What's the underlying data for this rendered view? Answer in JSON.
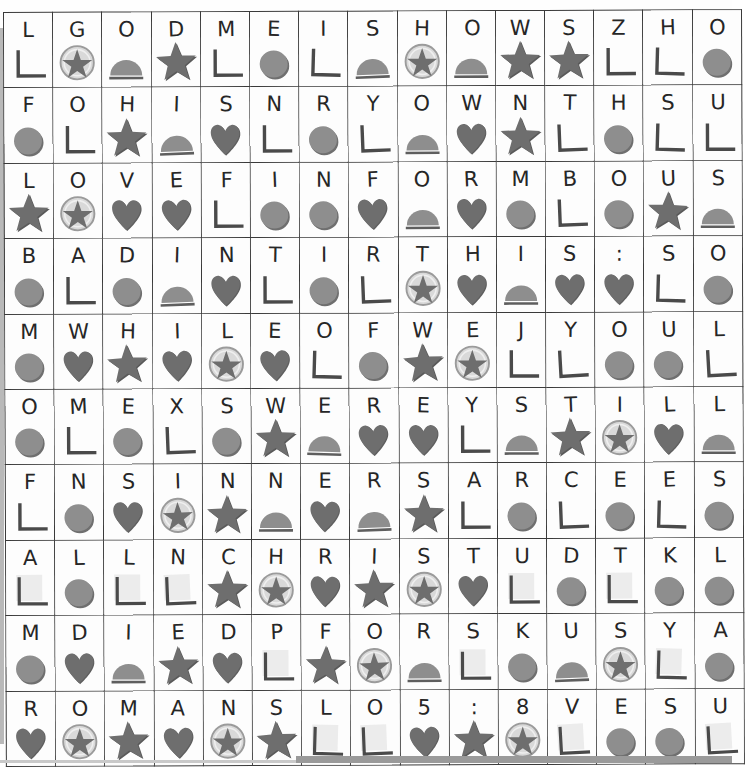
{
  "page": {
    "columns": 15,
    "rows": 10,
    "colors": {
      "grid_line": "#3a3a3a",
      "letter": "#262626",
      "symbol_dark": "#6e6e6e",
      "symbol_mid": "#8e8e8e",
      "symbol_light": "#c8c8c8",
      "symbol_outline": "#4a4a4a",
      "page_background": "#fdfdfd"
    },
    "symbol_legend": [
      {
        "id": "corner",
        "name": "corner-bracket-symbol",
        "description": "bottom-left L shaped bracket"
      },
      {
        "id": "circle",
        "name": "filled-circle-symbol",
        "description": "solid gray circle"
      },
      {
        "id": "dome",
        "name": "half-circle-symbol",
        "description": "gray semicircle sitting on a line"
      },
      {
        "id": "heart",
        "name": "heart-symbol",
        "description": "solid gray heart"
      },
      {
        "id": "star",
        "name": "star-symbol",
        "description": "solid gray five pointed star"
      },
      {
        "id": "star-circle",
        "name": "star-in-circle-symbol",
        "description": "gray star inside a light circle"
      },
      {
        "id": "square",
        "name": "empty-square-symbol",
        "description": "pale square with corner bracket"
      }
    ],
    "message_text": "LGODMEISHOWSZHO FOHISNRYOWNTHSU LOVEFINFORMBOUS BADINTIRTHIS:SO MWHILEOFWEJYOUL OMEXSWEREYSTILL FNSINNERSARCEES ALLNCHRISTUDTKL MDIEDPFORSKUSYA ROMANSLO5:8VESU",
    "grid": [
      {
        "row": 1,
        "cells": [
          {
            "letter": "L",
            "symbol": "corner"
          },
          {
            "letter": "G",
            "symbol": "star-circle"
          },
          {
            "letter": "O",
            "symbol": "dome"
          },
          {
            "letter": "D",
            "symbol": "star"
          },
          {
            "letter": "M",
            "symbol": "corner"
          },
          {
            "letter": "E",
            "symbol": "circle"
          },
          {
            "letter": "I",
            "symbol": "corner"
          },
          {
            "letter": "S",
            "symbol": "dome"
          },
          {
            "letter": "H",
            "symbol": "star-circle"
          },
          {
            "letter": "O",
            "symbol": "dome"
          },
          {
            "letter": "W",
            "symbol": "star"
          },
          {
            "letter": "S",
            "symbol": "star"
          },
          {
            "letter": "Z",
            "symbol": "corner"
          },
          {
            "letter": "H",
            "symbol": "corner"
          },
          {
            "letter": "O",
            "symbol": "circle"
          }
        ]
      },
      {
        "row": 2,
        "cells": [
          {
            "letter": "F",
            "symbol": "circle"
          },
          {
            "letter": "O",
            "symbol": "corner"
          },
          {
            "letter": "H",
            "symbol": "star"
          },
          {
            "letter": "I",
            "symbol": "dome"
          },
          {
            "letter": "S",
            "symbol": "heart"
          },
          {
            "letter": "N",
            "symbol": "corner"
          },
          {
            "letter": "R",
            "symbol": "circle"
          },
          {
            "letter": "Y",
            "symbol": "corner"
          },
          {
            "letter": "O",
            "symbol": "dome"
          },
          {
            "letter": "W",
            "symbol": "heart"
          },
          {
            "letter": "N",
            "symbol": "star"
          },
          {
            "letter": "T",
            "symbol": "corner"
          },
          {
            "letter": "H",
            "symbol": "circle"
          },
          {
            "letter": "S",
            "symbol": "corner"
          },
          {
            "letter": "U",
            "symbol": "corner"
          }
        ]
      },
      {
        "row": 3,
        "cells": [
          {
            "letter": "L",
            "symbol": "star"
          },
          {
            "letter": "O",
            "symbol": "star-circle"
          },
          {
            "letter": "V",
            "symbol": "heart"
          },
          {
            "letter": "E",
            "symbol": "heart"
          },
          {
            "letter": "F",
            "symbol": "corner"
          },
          {
            "letter": "I",
            "symbol": "circle"
          },
          {
            "letter": "N",
            "symbol": "circle"
          },
          {
            "letter": "F",
            "symbol": "heart"
          },
          {
            "letter": "O",
            "symbol": "dome"
          },
          {
            "letter": "R",
            "symbol": "heart"
          },
          {
            "letter": "M",
            "symbol": "circle"
          },
          {
            "letter": "B",
            "symbol": "corner"
          },
          {
            "letter": "O",
            "symbol": "circle"
          },
          {
            "letter": "U",
            "symbol": "star"
          },
          {
            "letter": "S",
            "symbol": "dome"
          }
        ]
      },
      {
        "row": 4,
        "cells": [
          {
            "letter": "B",
            "symbol": "circle"
          },
          {
            "letter": "A",
            "symbol": "corner"
          },
          {
            "letter": "D",
            "symbol": "circle"
          },
          {
            "letter": "I",
            "symbol": "dome"
          },
          {
            "letter": "N",
            "symbol": "heart"
          },
          {
            "letter": "T",
            "symbol": "corner"
          },
          {
            "letter": "I",
            "symbol": "circle"
          },
          {
            "letter": "R",
            "symbol": "corner"
          },
          {
            "letter": "T",
            "symbol": "star-circle"
          },
          {
            "letter": "H",
            "symbol": "heart"
          },
          {
            "letter": "I",
            "symbol": "dome"
          },
          {
            "letter": "S",
            "symbol": "heart"
          },
          {
            "letter": ":",
            "symbol": "heart"
          },
          {
            "letter": "S",
            "symbol": "corner"
          },
          {
            "letter": "O",
            "symbol": "circle"
          }
        ]
      },
      {
        "row": 5,
        "cells": [
          {
            "letter": "M",
            "symbol": "circle"
          },
          {
            "letter": "W",
            "symbol": "heart"
          },
          {
            "letter": "H",
            "symbol": "star"
          },
          {
            "letter": "I",
            "symbol": "heart"
          },
          {
            "letter": "L",
            "symbol": "star-circle"
          },
          {
            "letter": "E",
            "symbol": "heart"
          },
          {
            "letter": "O",
            "symbol": "corner"
          },
          {
            "letter": "F",
            "symbol": "circle"
          },
          {
            "letter": "W",
            "symbol": "star"
          },
          {
            "letter": "E",
            "symbol": "star-circle"
          },
          {
            "letter": "J",
            "symbol": "corner"
          },
          {
            "letter": "Y",
            "symbol": "corner"
          },
          {
            "letter": "O",
            "symbol": "circle"
          },
          {
            "letter": "U",
            "symbol": "circle"
          },
          {
            "letter": "L",
            "symbol": "corner"
          }
        ]
      },
      {
        "row": 6,
        "cells": [
          {
            "letter": "O",
            "symbol": "circle"
          },
          {
            "letter": "M",
            "symbol": "corner"
          },
          {
            "letter": "E",
            "symbol": "circle"
          },
          {
            "letter": "X",
            "symbol": "corner"
          },
          {
            "letter": "S",
            "symbol": "circle"
          },
          {
            "letter": "W",
            "symbol": "star"
          },
          {
            "letter": "E",
            "symbol": "dome"
          },
          {
            "letter": "R",
            "symbol": "heart"
          },
          {
            "letter": "E",
            "symbol": "heart"
          },
          {
            "letter": "Y",
            "symbol": "corner"
          },
          {
            "letter": "S",
            "symbol": "dome"
          },
          {
            "letter": "T",
            "symbol": "star"
          },
          {
            "letter": "I",
            "symbol": "star-circle"
          },
          {
            "letter": "L",
            "symbol": "heart"
          },
          {
            "letter": "L",
            "symbol": "dome"
          }
        ]
      },
      {
        "row": 7,
        "cells": [
          {
            "letter": "F",
            "symbol": "corner"
          },
          {
            "letter": "N",
            "symbol": "circle"
          },
          {
            "letter": "S",
            "symbol": "heart"
          },
          {
            "letter": "I",
            "symbol": "star-circle"
          },
          {
            "letter": "N",
            "symbol": "star"
          },
          {
            "letter": "N",
            "symbol": "dome"
          },
          {
            "letter": "E",
            "symbol": "heart"
          },
          {
            "letter": "R",
            "symbol": "dome"
          },
          {
            "letter": "S",
            "symbol": "star"
          },
          {
            "letter": "A",
            "symbol": "corner"
          },
          {
            "letter": "R",
            "symbol": "circle"
          },
          {
            "letter": "C",
            "symbol": "corner"
          },
          {
            "letter": "E",
            "symbol": "circle"
          },
          {
            "letter": "E",
            "symbol": "corner"
          },
          {
            "letter": "S",
            "symbol": "circle"
          }
        ]
      },
      {
        "row": 8,
        "cells": [
          {
            "letter": "A",
            "symbol": "square"
          },
          {
            "letter": "L",
            "symbol": "circle"
          },
          {
            "letter": "L",
            "symbol": "square"
          },
          {
            "letter": "N",
            "symbol": "square"
          },
          {
            "letter": "C",
            "symbol": "star"
          },
          {
            "letter": "H",
            "symbol": "star-circle"
          },
          {
            "letter": "R",
            "symbol": "heart"
          },
          {
            "letter": "I",
            "symbol": "star"
          },
          {
            "letter": "S",
            "symbol": "star-circle"
          },
          {
            "letter": "T",
            "symbol": "heart"
          },
          {
            "letter": "U",
            "symbol": "square"
          },
          {
            "letter": "D",
            "symbol": "circle"
          },
          {
            "letter": "T",
            "symbol": "square"
          },
          {
            "letter": "K",
            "symbol": "circle"
          },
          {
            "letter": "L",
            "symbol": "circle"
          }
        ]
      },
      {
        "row": 9,
        "cells": [
          {
            "letter": "M",
            "symbol": "circle"
          },
          {
            "letter": "D",
            "symbol": "heart"
          },
          {
            "letter": "I",
            "symbol": "dome"
          },
          {
            "letter": "E",
            "symbol": "star"
          },
          {
            "letter": "D",
            "symbol": "heart"
          },
          {
            "letter": "P",
            "symbol": "square"
          },
          {
            "letter": "F",
            "symbol": "star"
          },
          {
            "letter": "O",
            "symbol": "star-circle"
          },
          {
            "letter": "R",
            "symbol": "dome"
          },
          {
            "letter": "S",
            "symbol": "square"
          },
          {
            "letter": "K",
            "symbol": "circle"
          },
          {
            "letter": "U",
            "symbol": "dome"
          },
          {
            "letter": "S",
            "symbol": "star-circle"
          },
          {
            "letter": "Y",
            "symbol": "square"
          },
          {
            "letter": "A",
            "symbol": "circle"
          }
        ]
      },
      {
        "row": 10,
        "cells": [
          {
            "letter": "R",
            "symbol": "heart"
          },
          {
            "letter": "O",
            "symbol": "star-circle"
          },
          {
            "letter": "M",
            "symbol": "star"
          },
          {
            "letter": "A",
            "symbol": "heart"
          },
          {
            "letter": "N",
            "symbol": "star-circle"
          },
          {
            "letter": "S",
            "symbol": "star"
          },
          {
            "letter": "L",
            "symbol": "square"
          },
          {
            "letter": "O",
            "symbol": "square"
          },
          {
            "letter": "5",
            "symbol": "heart"
          },
          {
            "letter": ":",
            "symbol": "star"
          },
          {
            "letter": "8",
            "symbol": "star-circle"
          },
          {
            "letter": "V",
            "symbol": "square"
          },
          {
            "letter": "E",
            "symbol": "circle"
          },
          {
            "letter": "S",
            "symbol": "circle"
          },
          {
            "letter": "U",
            "symbol": "square"
          }
        ]
      }
    ]
  }
}
